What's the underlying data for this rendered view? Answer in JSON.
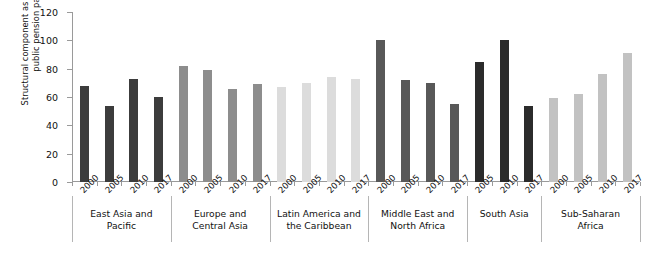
{
  "chart_data": {
    "type": "bar",
    "title": "",
    "xlabel": "",
    "ylabel": "Structural component as a percentage of public pension payments",
    "ylim": [
      0,
      120
    ],
    "yticks": [
      0,
      20,
      40,
      60,
      80,
      100,
      120
    ],
    "grid": false,
    "legend": "none",
    "categories": [
      "2000",
      "2005",
      "2010",
      "2017"
    ],
    "groups": [
      {
        "name": "East Asia and Pacific",
        "name_lines": [
          "East Asia and",
          "Pacific"
        ],
        "color": "#3c3c3c",
        "points": [
          {
            "year": "2000",
            "value": 68
          },
          {
            "year": "2005",
            "value": 54
          },
          {
            "year": "2010",
            "value": 73
          },
          {
            "year": "2017",
            "value": 60
          }
        ]
      },
      {
        "name": "Europe and Central Asia",
        "name_lines": [
          "Europe and",
          "Central Asia"
        ],
        "color": "#8d8d8d",
        "points": [
          {
            "year": "2000",
            "value": 82
          },
          {
            "year": "2005",
            "value": 79
          },
          {
            "year": "2010",
            "value": 66
          },
          {
            "year": "2017",
            "value": 69
          }
        ]
      },
      {
        "name": "Latin America and the Caribbean",
        "name_lines": [
          "Latin America and",
          "the Caribbean"
        ],
        "color": "#dcdcdc",
        "points": [
          {
            "year": "2000",
            "value": 67
          },
          {
            "year": "2005",
            "value": 70
          },
          {
            "year": "2010",
            "value": 74
          },
          {
            "year": "2017",
            "value": 73
          }
        ]
      },
      {
        "name": "Middle East and North Africa",
        "name_lines": [
          "Middle East and",
          "North Africa"
        ],
        "color": "#585858",
        "points": [
          {
            "year": "2000",
            "value": 100
          },
          {
            "year": "2005",
            "value": 72
          },
          {
            "year": "2010",
            "value": 70
          },
          {
            "year": "2017",
            "value": 55
          }
        ]
      },
      {
        "name": "South Asia",
        "name_lines": [
          "South Asia"
        ],
        "color": "#2b2b2b",
        "points": [
          {
            "year": "2005",
            "value": 85
          },
          {
            "year": "2010",
            "value": 100
          },
          {
            "year": "2017",
            "value": 54
          }
        ]
      },
      {
        "name": "Sub-Saharan Africa",
        "name_lines": [
          "Sub-Saharan",
          "Africa"
        ],
        "color": "#c2c2c2",
        "points": [
          {
            "year": "2000",
            "value": 59
          },
          {
            "year": "2005",
            "value": 62
          },
          {
            "year": "2010",
            "value": 76
          },
          {
            "year": "2017",
            "value": 91
          }
        ]
      }
    ]
  }
}
